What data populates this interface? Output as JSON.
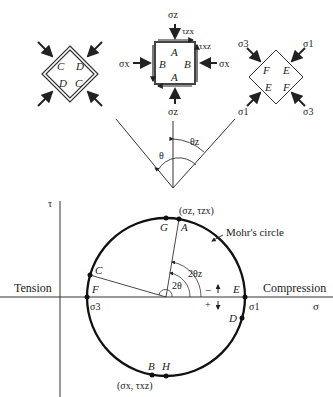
{
  "elements": {
    "left": {
      "labels": [
        "C",
        "D",
        "D",
        "C"
      ]
    },
    "middle": {
      "labels": [
        "A",
        "B",
        "B",
        "A"
      ],
      "sigma_z_top": "σz",
      "sigma_z_bottom": "σz",
      "sigma_x_left": "σx",
      "sigma_x_right": "σx",
      "tau_zx": "τzx",
      "tau_xz": "τxz"
    },
    "right": {
      "labels": [
        "F",
        "E",
        "E",
        "F"
      ],
      "sigma3_top": "σ3",
      "sigma1_top": "σ1",
      "sigma1_bottom": "σ1",
      "sigma3_bottom": "σ3"
    }
  },
  "angle_diagram": {
    "theta": "θ",
    "theta_z": "θz"
  },
  "mohr": {
    "tau_axis": "τ",
    "sigma_axis": "σ",
    "tension": "Tension",
    "compression": "Compression",
    "circle_label": "Mohr's circle",
    "point_A_coord": "(σz, τzx)",
    "point_B_coord": "(σx, τxz)",
    "points": {
      "A": "A",
      "B": "B",
      "C": "C",
      "D": "D",
      "E": "E",
      "F": "F",
      "G": "G",
      "H": "H"
    },
    "sigma1": "σ1",
    "sigma3": "σ3",
    "two_theta": "2θ",
    "two_theta_z": "2θz",
    "minus": "−",
    "plus": "+"
  }
}
